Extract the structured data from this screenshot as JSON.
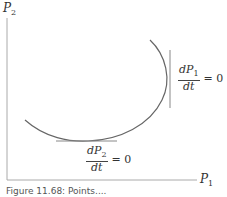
{
  "figure": {
    "y_axis_label": "P",
    "y_axis_sub": "2",
    "x_axis_label": "P",
    "x_axis_sub": "1",
    "annotation_right": {
      "numerator": "dP",
      "num_sub": "1",
      "denominator": "dt",
      "equals": "= 0"
    },
    "annotation_bottom": {
      "numerator": "dP",
      "num_sub": "2",
      "denominator": "dt",
      "equals": "= 0"
    },
    "caption": "Figure 11.68: Points....",
    "colors": {
      "axis": "#aaaaaa",
      "curve": "#666666",
      "tangent": "#888888"
    }
  }
}
